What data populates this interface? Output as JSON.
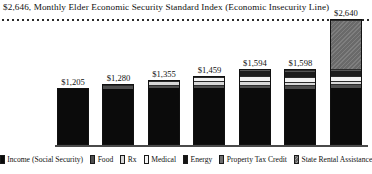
{
  "chart_data": {
    "type": "bar",
    "stacked": true,
    "title": "$2,646, Monthly Elder Economic Security Standard Index (Economic Insecurity Line)",
    "xlabel": "",
    "ylabel": "",
    "ylim": [
      0,
      2646
    ],
    "grid": false,
    "legend_position": "bottom",
    "threshold": {
      "label": "$2,646, Monthly Elder Economic Security Standard Index (Economic Insecurity Line)",
      "value": 2646,
      "style": "dotted"
    },
    "categories": [
      "1",
      "2",
      "3",
      "4",
      "5",
      "6",
      "7"
    ],
    "totals": [
      1205,
      1280,
      1355,
      1459,
      1594,
      1598,
      2640
    ],
    "total_labels": [
      "$1,205",
      "$1,280",
      "$1,355",
      "$1,459",
      "$1,594",
      "$1,598",
      "$2,640"
    ],
    "series": [
      {
        "name": "Income (Social Security)",
        "color": "#0b0b0b",
        "values": [
          1205,
          1205,
          1205,
          1205,
          1205,
          1205,
          1205
        ]
      },
      {
        "name": "Food",
        "color": "#4f4f4f",
        "values": [
          0,
          75,
          75,
          75,
          75,
          75,
          75
        ]
      },
      {
        "name": "Rx",
        "color": "#d8d8d8",
        "values": [
          0,
          0,
          75,
          75,
          75,
          75,
          75
        ]
      },
      {
        "name": "Medical",
        "color": "#f2f2f2",
        "values": [
          0,
          0,
          0,
          104,
          104,
          104,
          104
        ]
      },
      {
        "name": "Energy",
        "color": "#1c1c1c",
        "values": [
          0,
          0,
          0,
          0,
          135,
          135,
          135
        ]
      },
      {
        "name": "Property Tax Credit",
        "color": "#6e6e6e",
        "values": [
          0,
          0,
          0,
          0,
          0,
          4,
          4
        ]
      },
      {
        "name": "State Rental Assistance",
        "color": "#6a6a6a",
        "values": [
          0,
          0,
          0,
          0,
          0,
          0,
          1042
        ]
      }
    ]
  },
  "legend": {
    "items": [
      {
        "label": "Income (Social Security)",
        "swatch": "sw-income"
      },
      {
        "label": "Food",
        "swatch": "sw-food"
      },
      {
        "label": "Rx",
        "swatch": "sw-rx"
      },
      {
        "label": "Medical",
        "swatch": "sw-medical"
      },
      {
        "label": "Energy",
        "swatch": "sw-energy"
      },
      {
        "label": "Property Tax Credit",
        "swatch": "sw-ptc"
      },
      {
        "label": "State Rental Assistance",
        "swatch": "sw-rental"
      }
    ]
  }
}
